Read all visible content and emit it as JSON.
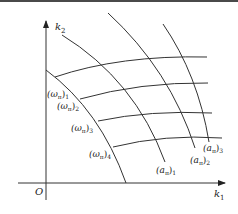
{
  "diagram": {
    "axes": {
      "x_label": "k",
      "x_sub": "1",
      "y_label": "k",
      "y_sub": "2",
      "origin": "O"
    },
    "omega_labels": [
      {
        "base": "(ω",
        "pi": "π",
        "close": ")",
        "sub": "1"
      },
      {
        "base": "(ω",
        "pi": "π",
        "close": ")",
        "sub": "2"
      },
      {
        "base": "(ω",
        "pi": "π",
        "close": ")",
        "sub": "3"
      },
      {
        "base": "(ω",
        "pi": "π",
        "close": ")",
        "sub": "4"
      }
    ],
    "a_labels": [
      {
        "base": "(a",
        "pi": "π",
        "close": ")",
        "sub": "1"
      },
      {
        "base": "(a",
        "pi": "π",
        "close": ")",
        "sub": "2"
      },
      {
        "base": "(a",
        "pi": "π",
        "close": ")",
        "sub": "3"
      }
    ],
    "line_color": "#333333"
  }
}
